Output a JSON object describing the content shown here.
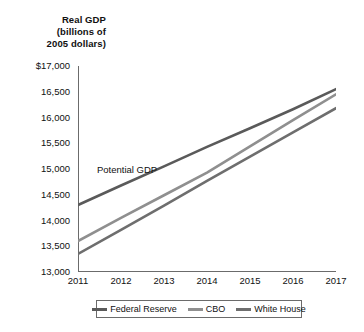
{
  "chart_data": {
    "type": "line",
    "title": "Real GDP (billions of 2005 dollars)",
    "title_lines": [
      "Real GDP",
      "(billions of",
      "2005 dollars)"
    ],
    "xlabel": "",
    "ylabel": "Real GDP (billions of 2005 dollars)",
    "x": [
      2011,
      2012,
      2013,
      2014,
      2015,
      2016,
      2017
    ],
    "categories": [
      "2011",
      "2012",
      "2013",
      "2014",
      "2015",
      "2016",
      "2017"
    ],
    "xlim": [
      2011,
      2017
    ],
    "ylim": [
      13000,
      17000
    ],
    "yticks": [
      13000,
      13500,
      14000,
      14500,
      15000,
      15500,
      16000,
      16500,
      17000
    ],
    "ytick_labels": [
      "13,000",
      "13,500",
      "14,000",
      "14,500",
      "15,000",
      "15,500",
      "16,000",
      "16,500",
      "$17,000"
    ],
    "grid": false,
    "legend_position": "bottom",
    "series": [
      {
        "name": "Federal Reserve",
        "color": "#5a5a5a",
        "values": [
          14300,
          14680,
          15050,
          15430,
          15790,
          16160,
          16550
        ]
      },
      {
        "name": "CBO",
        "color": "#8f8f8f",
        "values": [
          13600,
          14050,
          14490,
          14930,
          15440,
          15950,
          16450
        ]
      },
      {
        "name": "White House",
        "color": "#6e6e6e",
        "values": [
          13350,
          13820,
          14290,
          14770,
          15240,
          15710,
          16180
        ]
      }
    ],
    "annotations": [
      {
        "text": "Potential GDP",
        "x": 2012.2,
        "y": 15120
      }
    ]
  },
  "legend": {
    "items": [
      {
        "label": "Federal Reserve",
        "color": "#5a5a5a"
      },
      {
        "label": "CBO",
        "color": "#8f8f8f"
      },
      {
        "label": "White House",
        "color": "#6e6e6e"
      }
    ]
  },
  "colors": {
    "axis": "#6b6b6b",
    "text": "#111111",
    "background": "#ffffff"
  }
}
